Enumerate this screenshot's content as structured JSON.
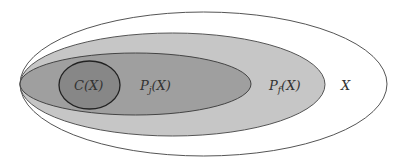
{
  "diagram": {
    "type": "nested-sets",
    "sets": [
      {
        "id": "X",
        "label": "X",
        "fill": "#ffffff",
        "stroke": "#555555"
      },
      {
        "id": "Pf",
        "label_main": "P",
        "label_sub": "f",
        "label_arg": "(X)",
        "fill": "#c6c6c6",
        "stroke": "#555555"
      },
      {
        "id": "Pj",
        "label_main": "P",
        "label_sub": "j",
        "label_arg": "(X)",
        "fill": "#9f9f9f",
        "stroke": "#444444"
      },
      {
        "id": "C",
        "label": "C(X)",
        "fill": "#878787",
        "stroke": "#222222"
      }
    ],
    "relation": "C(X) ⊂ Pj(X) ⊂ Pf(X) ⊂ X"
  }
}
